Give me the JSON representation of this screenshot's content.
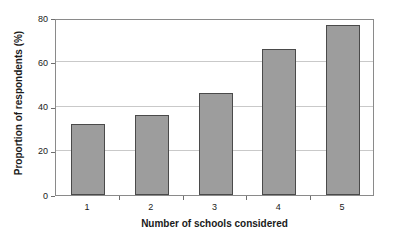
{
  "chart_data": {
    "type": "bar",
    "title": "",
    "categories": [
      "1",
      "2",
      "3",
      "4",
      "5"
    ],
    "values": [
      32,
      36,
      46,
      66,
      77
    ],
    "xlabel": "Number of schools considered",
    "ylabel": "Proportion of respondents (%)",
    "ylim": [
      0,
      80
    ],
    "yticks": [
      0,
      20,
      40,
      60,
      80
    ],
    "ytick_labels": [
      "0",
      "20",
      "40",
      "60",
      "80"
    ],
    "grid": true,
    "grid_axis": "y",
    "legend": false,
    "legend_position": "none",
    "series": [
      {
        "name": "Proportion of respondents (%)",
        "values": [
          32,
          36,
          46,
          66,
          77
        ]
      }
    ],
    "colors": {
      "bar_fill": "#9d9d9d",
      "bar_border": "#4a4a4a",
      "gridline": "#c9c9c9",
      "axis": "#8a8a8a",
      "text": "#1a1a1a",
      "background": "#ffffff"
    }
  }
}
